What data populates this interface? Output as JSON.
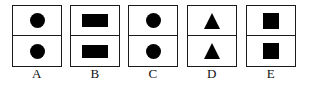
{
  "figure": {
    "type": "multiple-choice-shape-options",
    "background_color": "#ffffff",
    "border_color": "#1a1a1a",
    "shape_fill_color": "#000000",
    "label_color": "#111111",
    "options": [
      {
        "label": "A",
        "top_shape": "circle",
        "bottom_shape": "circle",
        "top_icon_name": "filled-circle-icon",
        "bottom_icon_name": "filled-circle-icon"
      },
      {
        "label": "B",
        "top_shape": "rectangle",
        "bottom_shape": "rectangle",
        "top_icon_name": "filled-rectangle-icon",
        "bottom_icon_name": "filled-rectangle-icon"
      },
      {
        "label": "C",
        "top_shape": "circle",
        "bottom_shape": "circle",
        "top_icon_name": "filled-circle-icon",
        "bottom_icon_name": "filled-circle-icon"
      },
      {
        "label": "D",
        "top_shape": "triangle",
        "bottom_shape": "triangle",
        "top_icon_name": "filled-triangle-up-icon",
        "bottom_icon_name": "filled-triangle-up-icon"
      },
      {
        "label": "E",
        "top_shape": "square",
        "bottom_shape": "square",
        "top_icon_name": "filled-square-icon",
        "bottom_icon_name": "filled-square-icon"
      }
    ]
  }
}
